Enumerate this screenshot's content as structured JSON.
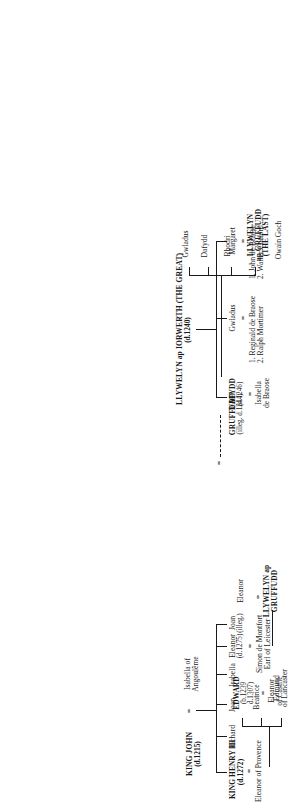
{
  "equals_sign": "=",
  "welsh": {
    "root": {
      "name": "LLYWELYN ap IORWERTH (THE GREAT)",
      "dates": "(d.1240)"
    },
    "children": [
      {
        "id": "gruffudd",
        "name": "GRUFFUDD",
        "dates": "(illeg. d.1244)",
        "illegitimate": true
      },
      {
        "id": "dafydd",
        "name": "DAFYDD",
        "dates": "(d.1246)"
      },
      {
        "id": "gwladus",
        "name": "Gwladus",
        "dates": ""
      },
      {
        "id": "margaret",
        "name": "Margaret",
        "dates": ""
      }
    ],
    "spouses": {
      "dafydd": [
        "Isabella",
        "de Braose"
      ],
      "gwladus": [
        "1. Reginald de Braose",
        "2. Ralph Mortimer"
      ],
      "margaret": [
        "1. John de Braose",
        "2. Walter Clifford"
      ]
    },
    "grandchildren": [
      {
        "id": "owain",
        "name": "Owain Goch",
        "dates": ""
      },
      {
        "id": "llywelyn",
        "name": "LLYWELYN\nap GRUFFUDD",
        "line1": "LLYWELYN",
        "line2": "ap GRUFFUDD",
        "dates": "(THE LAST)"
      },
      {
        "id": "rhodri",
        "name": "Rhodri",
        "dates": ""
      },
      {
        "id": "dafydd2",
        "name": "Dafydd",
        "dates": ""
      },
      {
        "id": "gwladus2",
        "name": "Gwladus",
        "dates": ""
      }
    ]
  },
  "english": {
    "root": {
      "name": "KING JOHN",
      "dates": "(d.1215)"
    },
    "root_spouse": {
      "line1": "Isabella of",
      "line2": "Angoulême"
    },
    "children": [
      {
        "id": "henry",
        "name": "KING HENRY III",
        "dates": "(d.1272)"
      },
      {
        "id": "richard",
        "name": "Richard",
        "dates": ""
      },
      {
        "id": "joan",
        "name": "Joan",
        "dates": ""
      },
      {
        "id": "isabella",
        "name": "Isabella",
        "dates": ""
      },
      {
        "id": "eleanor",
        "name": "Eleanor",
        "dates": "(d.1275)"
      },
      {
        "id": "joanill",
        "name": "Joan",
        "dates": "(illeg.)"
      }
    ],
    "spouses": {
      "henry": [
        "Eleanor of Provence"
      ],
      "eleanor": [
        "Simon de Montfort",
        "Earl of Leicester"
      ]
    },
    "grandchildren": [
      {
        "id": "edward",
        "line1": "EDWARD",
        "dates1": "(b.1239",
        "dates2": "d.1307)"
      },
      {
        "id": "beatrice",
        "line1": "Beatrice",
        "dates1": "",
        "dates2": ""
      },
      {
        "id": "edmund",
        "line1": "Edmund",
        "dates1": "of Lancaster",
        "dates2": ""
      }
    ],
    "edward_spouse": {
      "line1": "Eleanor",
      "line2": "of Castile"
    },
    "eleanor_daughter": {
      "name": "Eleanor",
      "spouse1": "LLYWELYN ap",
      "spouse2": "GRUFFUDD"
    }
  }
}
